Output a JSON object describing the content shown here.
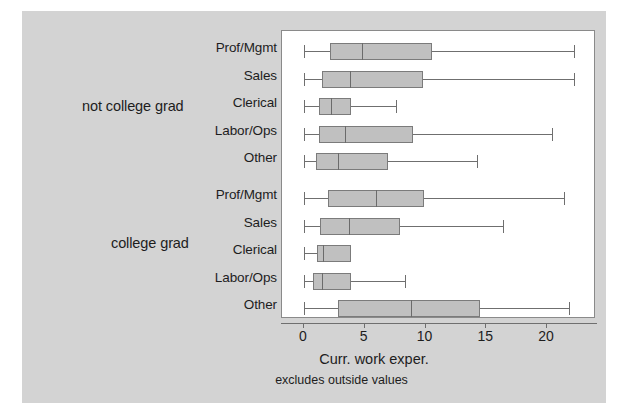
{
  "chart_data": {
    "type": "boxplot",
    "title": "",
    "xlabel": "Curr. work exper.",
    "note": "excludes outside values",
    "xlim": [
      -0.6,
      24.1
    ],
    "xticks": [
      0,
      5,
      10,
      15,
      20
    ],
    "xticklabels": [
      "0",
      "5",
      "10",
      "15",
      "20"
    ],
    "grid": false,
    "orientation": "horizontal",
    "groups": [
      {
        "label": "not college grad",
        "categories": [
          "Prof/Mgmt",
          "Sales",
          "Clerical",
          "Labor/Ops",
          "Other"
        ],
        "boxes": [
          {
            "category": "Prof/Mgmt",
            "whisker_low": 0.0,
            "q1": 2.1,
            "median": 4.8,
            "q3": 10.5,
            "whisker_high": 22.2
          },
          {
            "category": "Sales",
            "whisker_low": 0.0,
            "q1": 1.5,
            "median": 3.8,
            "q3": 9.8,
            "whisker_high": 22.2
          },
          {
            "category": "Clerical",
            "whisker_low": 0.0,
            "q1": 1.2,
            "median": 2.2,
            "q3": 3.9,
            "whisker_high": 7.6
          },
          {
            "category": "Labor/Ops",
            "whisker_low": 0.0,
            "q1": 1.2,
            "median": 3.4,
            "q3": 9.0,
            "whisker_high": 20.4
          },
          {
            "category": "Other",
            "whisker_low": 0.0,
            "q1": 1.0,
            "median": 2.8,
            "q3": 6.9,
            "whisker_high": 14.2
          }
        ]
      },
      {
        "label": "college grad",
        "categories": [
          "Prof/Mgmt",
          "Sales",
          "Clerical",
          "Labor/Ops",
          "Other"
        ],
        "boxes": [
          {
            "category": "Prof/Mgmt",
            "whisker_low": 0.0,
            "q1": 2.0,
            "median": 5.9,
            "q3": 9.9,
            "whisker_high": 21.4
          },
          {
            "category": "Sales",
            "whisker_low": 0.0,
            "q1": 1.3,
            "median": 3.7,
            "q3": 7.9,
            "whisker_high": 16.4
          },
          {
            "category": "Clerical",
            "whisker_low": 0.0,
            "q1": 1.1,
            "median": 1.6,
            "q3": 3.9,
            "whisker_high": 3.9
          },
          {
            "category": "Labor/Ops",
            "whisker_low": 0.0,
            "q1": 0.7,
            "median": 1.5,
            "q3": 3.9,
            "whisker_high": 8.3
          },
          {
            "category": "Other",
            "whisker_low": 0.0,
            "q1": 2.8,
            "median": 8.8,
            "q3": 14.5,
            "whisker_high": 21.8
          }
        ]
      }
    ],
    "colors": {
      "figure_background": "#d3d3d3",
      "plot_background": "#ffffff",
      "box_fill": "#c0c0c0",
      "box_edge": "#7b7b7b",
      "whisker": "#6f6f6f",
      "text": "#1d1d1d"
    }
  }
}
